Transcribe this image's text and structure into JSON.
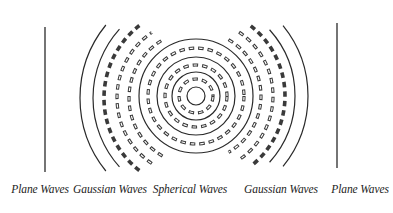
{
  "figure": {
    "width": 393,
    "height": 213,
    "stroke_color": "#2a2a2a",
    "dash_color": "#3a3a3a",
    "labels": [
      {
        "text": "Plane Waves",
        "x": 40
      },
      {
        "text": "Gaussian Waves",
        "x": 110
      },
      {
        "text": "Spherical Waves",
        "x": 190
      },
      {
        "text": "Gaussian Waves",
        "x": 281
      },
      {
        "text": "Plane Waves",
        "x": 360
      }
    ],
    "plane_waves": {
      "left": {
        "x": 45,
        "y1": 27,
        "y2": 172
      },
      "right": {
        "x": 337,
        "y1": 23,
        "y2": 168
      }
    },
    "spherical_waves": {
      "center": {
        "x": 196,
        "y": 96
      },
      "solid_radii": [
        9,
        24,
        39,
        57
      ],
      "dashed_radii": [
        17,
        31,
        48
      ]
    },
    "gaussian_waves": {
      "left": {
        "solid": [
          {
            "cx": 196,
            "cy": 98,
            "r": 116,
            "a1": 141,
            "a2": 219
          },
          {
            "cx": 196,
            "cy": 98,
            "r": 103,
            "a1": 138,
            "a2": 222
          }
        ],
        "dashed": [
          {
            "cx": 196,
            "cy": 98,
            "r": 92,
            "a1": 128,
            "a2": 232
          },
          {
            "cx": 196,
            "cy": 98,
            "r": 79,
            "a1": 124,
            "a2": 236
          },
          {
            "cx": 196,
            "cy": 98,
            "r": 67,
            "a1": 120,
            "a2": 240
          }
        ]
      },
      "right": {
        "solid": [
          {
            "cx": 196,
            "cy": 96,
            "r": 112,
            "a1": -39,
            "a2": 39
          },
          {
            "cx": 196,
            "cy": 96,
            "r": 99,
            "a1": -42,
            "a2": 42
          }
        ],
        "dashed": [
          {
            "cx": 196,
            "cy": 96,
            "r": 89,
            "a1": -52,
            "a2": 52
          },
          {
            "cx": 196,
            "cy": 96,
            "r": 77,
            "a1": -56,
            "a2": 56
          },
          {
            "cx": 196,
            "cy": 96,
            "r": 65,
            "a1": -60,
            "a2": 60
          }
        ]
      }
    }
  }
}
